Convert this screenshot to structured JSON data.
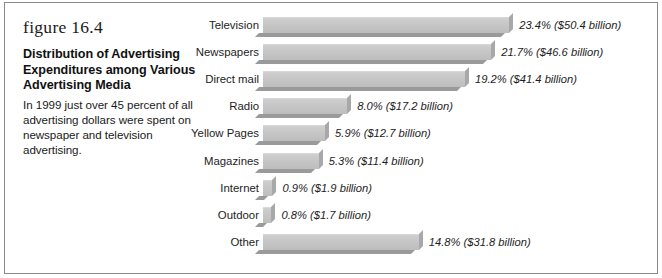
{
  "figure": {
    "number": "figure 16.4",
    "title": "Distribution of Advertising Expenditures among Various Advertising Media",
    "description": "In 1999 just over 45 percent of all advertising dollars were spent on newspaper and television advertising."
  },
  "chart_data": {
    "type": "bar",
    "orientation": "horizontal",
    "title": "Distribution of Advertising Expenditures among Various Advertising Media",
    "xlabel": "",
    "ylabel": "",
    "xlim": [
      0,
      25
    ],
    "grid": false,
    "legend": "none",
    "categories": [
      "Television",
      "Newspapers",
      "Direct mail",
      "Radio",
      "Yellow Pages",
      "Magazines",
      "Internet",
      "Outdoor",
      "Other"
    ],
    "values": [
      23.4,
      21.7,
      19.2,
      8.0,
      5.9,
      5.3,
      0.9,
      0.8,
      14.8
    ],
    "dollars_billion": [
      50.4,
      46.6,
      41.4,
      17.2,
      12.7,
      11.4,
      1.9,
      1.7,
      31.8
    ],
    "data_labels": [
      "23.4% ($50.4 billion)",
      "21.7% ($46.6 billion)",
      "19.2% ($41.4 billion)",
      "8.0% ($17.2 billion)",
      "5.9% ($12.7 billion)",
      "5.3% ($11.4 billion)",
      "0.9% ($1.9 billion)",
      "0.8% ($1.7 billion)",
      "14.8% ($31.8 billion)"
    ],
    "bar_color": "#c6c6c6",
    "bar_shadow_color": "#9a9a9a",
    "background": "#ffffff"
  }
}
